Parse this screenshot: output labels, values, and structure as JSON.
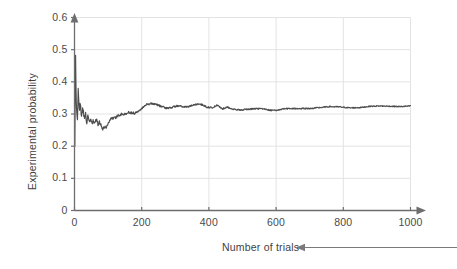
{
  "chart_data": {
    "type": "line",
    "title": "",
    "xlabel": "Number of trials",
    "ylabel": "Experimental probability",
    "xlim": [
      0,
      1000
    ],
    "ylim": [
      0,
      0.6
    ],
    "xticks": [
      0,
      200,
      400,
      600,
      800,
      1000
    ],
    "xtick_labels": [
      "0",
      "200",
      "400",
      "600",
      "800",
      "1000"
    ],
    "yticks": [
      0,
      0.1,
      0.2,
      0.3,
      0.4,
      0.5,
      0.6
    ],
    "ytick_labels": [
      "0",
      "0.1",
      "0.2",
      "0.3",
      "0.4",
      "0.5",
      "0.6"
    ],
    "grid": true,
    "legend": false,
    "line_color": "#4d4d4d",
    "grid_color": "#e3e3e3",
    "axis_color": "#6e6e6e",
    "converges_to": 0.33,
    "series": [
      {
        "name": "Experimental probability",
        "x": [
          1,
          3,
          5,
          7,
          9,
          11,
          13,
          15,
          17,
          19,
          21,
          24,
          27,
          30,
          33,
          36,
          40,
          44,
          48,
          52,
          56,
          60,
          65,
          70,
          75,
          80,
          85,
          90,
          95,
          100,
          110,
          120,
          130,
          140,
          150,
          160,
          170,
          180,
          190,
          200,
          215,
          230,
          245,
          260,
          275,
          290,
          305,
          320,
          335,
          350,
          365,
          380,
          395,
          410,
          425,
          440,
          455,
          470,
          485,
          500,
          520,
          540,
          560,
          580,
          600,
          620,
          640,
          660,
          680,
          700,
          730,
          760,
          790,
          820,
          850,
          880,
          910,
          940,
          970,
          1000
        ],
        "y": [
          0.2,
          0.5,
          0.34,
          0.3,
          0.28,
          0.38,
          0.33,
          0.3,
          0.355,
          0.31,
          0.29,
          0.325,
          0.3,
          0.285,
          0.305,
          0.275,
          0.29,
          0.275,
          0.285,
          0.268,
          0.278,
          0.272,
          0.283,
          0.268,
          0.277,
          0.262,
          0.252,
          0.262,
          0.258,
          0.272,
          0.288,
          0.287,
          0.296,
          0.3,
          0.299,
          0.305,
          0.304,
          0.302,
          0.31,
          0.318,
          0.33,
          0.333,
          0.329,
          0.323,
          0.318,
          0.321,
          0.325,
          0.323,
          0.322,
          0.326,
          0.331,
          0.329,
          0.321,
          0.32,
          0.327,
          0.316,
          0.322,
          0.315,
          0.313,
          0.313,
          0.315,
          0.317,
          0.316,
          0.312,
          0.311,
          0.316,
          0.317,
          0.317,
          0.317,
          0.317,
          0.32,
          0.323,
          0.322,
          0.319,
          0.32,
          0.324,
          0.325,
          0.324,
          0.323,
          0.325
        ]
      }
    ],
    "annotation": {
      "text": "",
      "arrow_direction": "left",
      "points_to": "Number of trials"
    }
  }
}
